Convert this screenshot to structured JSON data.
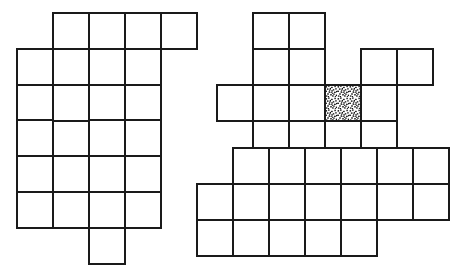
{
  "page": {
    "background_color": "#ffffff",
    "width": 415,
    "height": 252
  },
  "style": {
    "line_color": "#1a1a1a",
    "line_width": 2,
    "cell_fill": "#ffffff",
    "shaded_fill_color": "#111111",
    "shaded_pattern": "random-stipple-dots"
  },
  "figures": [
    {
      "id": "figure-top-left",
      "label": "Top-left polyomino",
      "origin_x": 16,
      "origin_y": 12,
      "cell_size": 36,
      "rows": 3,
      "cols": 5,
      "cell_count": 12,
      "shaded_cells": [],
      "cells": [
        [
          0,
          1
        ],
        [
          0,
          2
        ],
        [
          0,
          3
        ],
        [
          0,
          4
        ],
        [
          1,
          0
        ],
        [
          1,
          1
        ],
        [
          1,
          2
        ],
        [
          1,
          3
        ],
        [
          2,
          0
        ],
        [
          2,
          1
        ],
        [
          2,
          2
        ],
        [
          2,
          3
        ]
      ]
    },
    {
      "id": "figure-top-right",
      "label": "Top-right polyomino with shaded cell",
      "origin_x": 216,
      "origin_y": 12,
      "cell_size": 36,
      "rows": 4,
      "cols": 6,
      "cell_count": 15,
      "shaded_cells": [
        [
          2,
          3
        ]
      ],
      "cells": [
        [
          0,
          1
        ],
        [
          0,
          2
        ],
        [
          1,
          1
        ],
        [
          1,
          2
        ],
        [
          1,
          4
        ],
        [
          1,
          5
        ],
        [
          2,
          0
        ],
        [
          2,
          1
        ],
        [
          2,
          2
        ],
        [
          2,
          3
        ],
        [
          2,
          4
        ],
        [
          3,
          1
        ],
        [
          3,
          2
        ],
        [
          3,
          3
        ],
        [
          3,
          4
        ]
      ]
    },
    {
      "id": "figure-bottom-left",
      "label": "Bottom-left polyomino",
      "origin_x": 16,
      "origin_y": 119,
      "cell_size": 36,
      "rows": 4,
      "cols": 4,
      "cell_count": 12,
      "shaded_cells": [],
      "cells": [
        [
          0,
          0
        ],
        [
          0,
          2
        ],
        [
          0,
          3
        ],
        [
          1,
          0
        ],
        [
          1,
          1
        ],
        [
          1,
          2
        ],
        [
          1,
          3
        ],
        [
          2,
          0
        ],
        [
          2,
          1
        ],
        [
          2,
          2
        ],
        [
          2,
          3
        ],
        [
          3,
          2
        ]
      ]
    },
    {
      "id": "figure-bottom-right",
      "label": "Bottom-right polyomino",
      "origin_x": 196,
      "origin_y": 147,
      "cell_size": 36,
      "rows": 3,
      "cols": 7,
      "cell_count": 18,
      "shaded_cells": [],
      "cells": [
        [
          0,
          1
        ],
        [
          0,
          2
        ],
        [
          0,
          3
        ],
        [
          0,
          4
        ],
        [
          0,
          5
        ],
        [
          0,
          6
        ],
        [
          1,
          0
        ],
        [
          1,
          1
        ],
        [
          1,
          2
        ],
        [
          1,
          3
        ],
        [
          1,
          4
        ],
        [
          1,
          5
        ],
        [
          1,
          6
        ],
        [
          2,
          0
        ],
        [
          2,
          1
        ],
        [
          2,
          2
        ],
        [
          2,
          3
        ],
        [
          2,
          4
        ]
      ]
    }
  ]
}
